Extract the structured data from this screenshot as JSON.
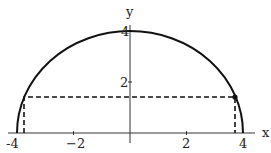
{
  "diagram": {
    "type": "semicircle-plot",
    "curve": "y = sqrt(16 - x^2)",
    "radius": 4,
    "axes": {
      "x_label": "x",
      "y_label": "y",
      "x_ticks": [
        "-4",
        "-2",
        "2",
        "4"
      ],
      "y_ticks": [
        "2",
        "4"
      ]
    },
    "marked_point": {
      "x": 3.74,
      "y": 1.41
    },
    "dashed_rectangle": {
      "x_min": -3.74,
      "x_max": 3.74,
      "y": 1.41
    }
  },
  "labels": {
    "x_axis": "x",
    "y_axis": "y",
    "xt_m4": "-4",
    "xt_m2": "−2",
    "xt_2": "2",
    "xt_4": "4",
    "yt_2": "2",
    "yt_4": "4"
  }
}
